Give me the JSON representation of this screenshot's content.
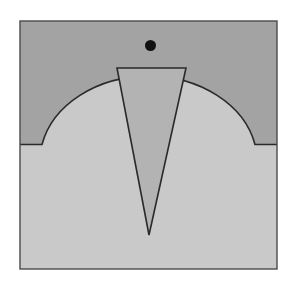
{
  "diagram": {
    "colors": {
      "background": "#ffffff",
      "upper_region": "#a3a3a3",
      "lower_region": "#c9c9c9",
      "wedge": "#b3b3b3",
      "outline": "#2a2a2a",
      "dot": "#111111"
    },
    "frame": {
      "x": 20,
      "y": 21,
      "width": 257,
      "height": 248
    },
    "step_line_y": 144.5,
    "cap_left_x": 42,
    "cap_right_x": 255,
    "cap_top_y": 74,
    "wedge": {
      "top_left": [
        117,
        68
      ],
      "top_right": [
        186,
        68
      ],
      "apex": [
        149,
        235
      ]
    },
    "dot": {
      "cx": 150.5,
      "cy": 45.5,
      "r": 5.5
    }
  }
}
